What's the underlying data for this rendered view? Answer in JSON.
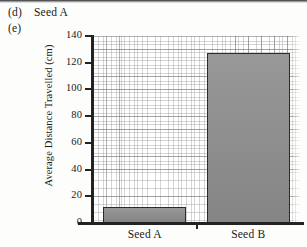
{
  "annotations": {
    "item_d_tag": "(d)",
    "item_d_answer": "Seed A",
    "item_e_tag": "(e)"
  },
  "chart_data": {
    "type": "bar",
    "title": "",
    "xlabel": "",
    "ylabel": "Average Distance Travelled (cm)",
    "categories": [
      "Seed A",
      "Seed B"
    ],
    "values": [
      12,
      127
    ],
    "ylim": [
      0,
      140
    ],
    "ytick_values": [
      0,
      20,
      40,
      60,
      80,
      100,
      120,
      140
    ],
    "ytick_labels": [
      "0",
      "20",
      "40",
      "60",
      "80",
      "100",
      "120",
      "140"
    ],
    "grid": "graph-paper",
    "legend": "none",
    "bar_color": "#8c8c8c",
    "bar_edge_color": "#2b2b2b",
    "axis_color": "#232323"
  }
}
